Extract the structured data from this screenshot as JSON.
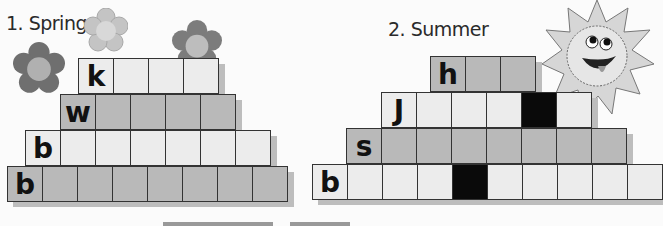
{
  "colors": {
    "light": "#ececec",
    "gray": "#b9b9b9",
    "black": "#0a0a0a"
  },
  "puzzles": [
    {
      "title": "1. Spring",
      "rows": [
        {
          "letter": "k",
          "cells": 4,
          "shade": "light",
          "black_cells": []
        },
        {
          "letter": "w",
          "cells": 5,
          "shade": "gray",
          "black_cells": []
        },
        {
          "letter": "b",
          "cells": 7,
          "shade": "light",
          "black_cells": []
        },
        {
          "letter": "b",
          "cells": 8,
          "shade": "gray",
          "black_cells": []
        }
      ]
    },
    {
      "title": "2. Summer",
      "rows": [
        {
          "letter": "h",
          "cells": 3,
          "shade": "gray",
          "black_cells": []
        },
        {
          "letter": "J",
          "cells": 6,
          "shade": "light",
          "black_cells": [
            4
          ]
        },
        {
          "letter": "s",
          "cells": 8,
          "shade": "gray",
          "black_cells": []
        },
        {
          "letter": "b",
          "cells": 10,
          "shade": "light",
          "black_cells": [
            4
          ]
        }
      ]
    }
  ]
}
